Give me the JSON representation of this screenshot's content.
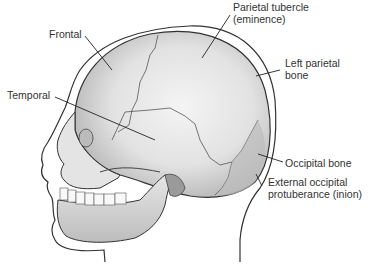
{
  "figure": {
    "labels": [
      {
        "id": "frontal",
        "text": "Frontal"
      },
      {
        "id": "temporal",
        "text": "Temporal"
      },
      {
        "id": "parietal-tubercle",
        "line1": "Parietal tubercle",
        "line2": "(eminence)"
      },
      {
        "id": "left-parietal",
        "line1": "Left parietal",
        "line2": "bone"
      },
      {
        "id": "occipital",
        "text": "Occipital bone"
      },
      {
        "id": "ext-occipital",
        "line1": "External occipital",
        "line2": "protuberance (inion)"
      }
    ],
    "colors": {
      "bone_light": "#f2f2f2",
      "bone_mid": "#d6d6d6",
      "bone_dark": "#a8a8a8",
      "outline": "#333333",
      "text": "#333333"
    }
  }
}
